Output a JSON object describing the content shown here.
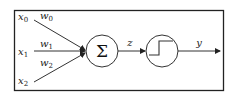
{
  "diagram": {
    "type": "perceptron",
    "inputs": [
      {
        "var": "x",
        "sub": "0",
        "weight_var": "w",
        "weight_sub": "0"
      },
      {
        "var": "x",
        "sub": "1",
        "weight_var": "w",
        "weight_sub": "1"
      },
      {
        "var": "x",
        "sub": "2",
        "weight_var": "w",
        "weight_sub": "2"
      }
    ],
    "sum_node": {
      "symbol": "Σ"
    },
    "sum_output_label": "z",
    "activation_node": {
      "kind": "step-function"
    },
    "output_label": "y"
  },
  "colors": {
    "stroke": "#333333",
    "border": "#222222",
    "background": "#ffffff"
  }
}
